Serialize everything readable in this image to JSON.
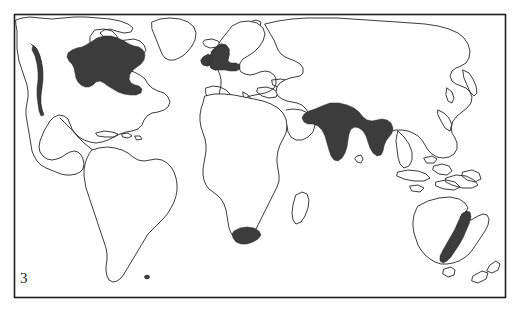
{
  "figure": {
    "number": "3",
    "caption_label": "3",
    "type": "world-map-distribution",
    "title": "",
    "frame": {
      "x": 14,
      "y": 14,
      "width": 492,
      "height": 284
    }
  },
  "colors": {
    "background": "#ffffff",
    "coastline_stroke": "#262626",
    "shaded_fill": "#3c3c3c",
    "frame_stroke": "#1f1f1f",
    "label_text": "#1a1a1a"
  },
  "map": {
    "projection": "equirectangular-world",
    "continents": [
      "North America",
      "South America",
      "Europe",
      "Africa",
      "Asia",
      "Australia",
      "Greenland"
    ],
    "shaded_regions": [
      {
        "name": "pacific-northwest-coast",
        "label": "Pacific Northwest coast of North America"
      },
      {
        "name": "eastern-north-america",
        "label": "Great Lakes and northeastern North America"
      },
      {
        "name": "british-isles-northwest-europe",
        "label": "British Isles and northwest Europe"
      },
      {
        "name": "indian-subcontinent",
        "label": "Indian subcontinent and adjacent South Asia"
      },
      {
        "name": "south-africa-cape",
        "label": "Southern tip of South Africa"
      },
      {
        "name": "eastern-australia",
        "label": "Eastern coastal Australia"
      }
    ],
    "unshaded_regions": [
      "South America",
      "Central and Northern Africa",
      "Siberia and East Asia",
      "Greenland",
      "Scandinavia"
    ]
  }
}
